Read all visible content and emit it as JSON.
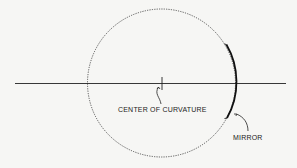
{
  "diagram": {
    "labels": {
      "center": "CENTER OF CURVATURE",
      "mirror": "MIRROR"
    },
    "colors": {
      "ink": "#222222",
      "background": "#f6f6f4"
    }
  }
}
